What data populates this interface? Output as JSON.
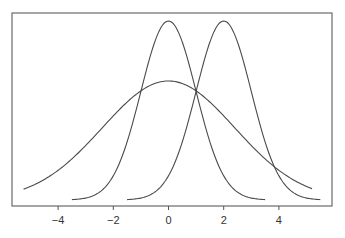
{
  "chart_data": {
    "type": "line",
    "title": "",
    "xlabel": "",
    "ylabel": "",
    "xlim": [
      -5.75,
      5.9
    ],
    "grid": false,
    "legend": null,
    "x_ticks": [
      -4,
      -2,
      0,
      2,
      4
    ],
    "x_tick_labels": [
      "−4",
      "−2",
      "0",
      "2",
      "4"
    ],
    "y_ticks": [],
    "series": [
      {
        "name": "narrow bell centered at 0",
        "kind": "gaussian",
        "mean": 0,
        "sd": 1.0,
        "relative_peak": 1.0,
        "x_range": [
          -3.5,
          3.5
        ]
      },
      {
        "name": "narrow bell centered at 2",
        "kind": "gaussian",
        "mean": 2,
        "sd": 1.0,
        "relative_peak": 1.0,
        "x_range": [
          -1.5,
          5.5
        ]
      },
      {
        "name": "wide bell centered at 0",
        "kind": "gaussian",
        "mean": 0,
        "sd": 2.4,
        "relative_peak": 0.665,
        "x_range": [
          -5.25,
          5.2
        ]
      }
    ],
    "annotations": [
      "all three curves intersect near x = 1"
    ]
  },
  "layout": {
    "frame": {
      "left": 12,
      "top": 13,
      "right": 332,
      "bottom": 206
    },
    "x0_px": 168.5,
    "px_per_unit": 27.6,
    "baseline_px": 200,
    "peak_height_px": 179,
    "colors": {
      "curve": "#4a4a4a",
      "frame": "#6a6a6a",
      "background": "#ffffff"
    }
  }
}
